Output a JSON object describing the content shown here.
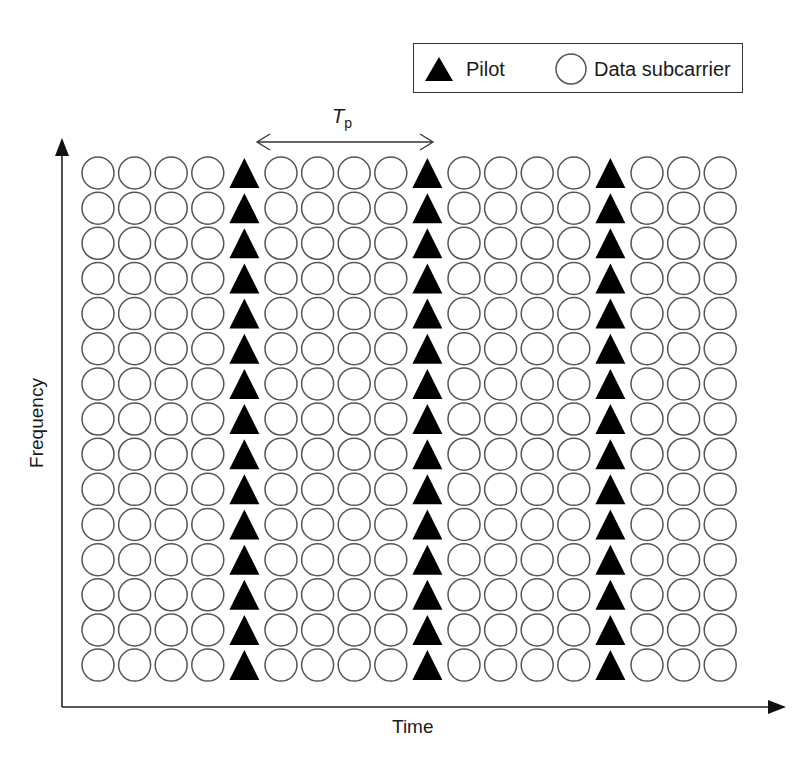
{
  "diagram": {
    "type": "ofdm-pilot-pattern",
    "legend": {
      "pilot_label": "Pilot",
      "data_label": "Data subcarrier"
    },
    "axes": {
      "x_label": "Time",
      "y_label": "Frequency"
    },
    "pilot_spacing": {
      "symbol": "T",
      "subscript": "p"
    },
    "grid": {
      "rows": 15,
      "columns": 18,
      "pilot_columns": [
        4,
        9,
        14
      ],
      "col_start_x": 98,
      "col_pitch": 36.6,
      "row_start_y": 173,
      "row_pitch": 35.15,
      "circle_radius": 16,
      "triangle_width": 30,
      "triangle_height": 30
    },
    "colors": {
      "circle_stroke": "#555555",
      "pilot_fill": "#000000",
      "axis": "#222222"
    }
  }
}
